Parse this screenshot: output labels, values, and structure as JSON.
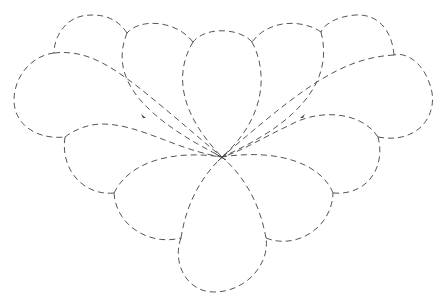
{
  "figure": {
    "title": "Dashed petal fan outline",
    "stroke_color": "#555555",
    "background_color": "#ffffff",
    "stroke_style": "dashed",
    "center_point": [
      222,
      157
    ],
    "petal_count": 9,
    "outer_cusps": [
      [
        181,
        238
      ],
      [
        114,
        193
      ],
      [
        65,
        137
      ],
      [
        54,
        53
      ],
      [
        127,
        33
      ],
      [
        193,
        42
      ],
      [
        252,
        42
      ],
      [
        321,
        32
      ],
      [
        394,
        55
      ],
      [
        378,
        137
      ],
      [
        333,
        193
      ],
      [
        266,
        238
      ]
    ]
  }
}
